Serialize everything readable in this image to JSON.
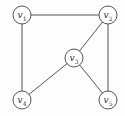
{
  "diagram": {
    "type": "graph",
    "nodes": [
      {
        "id": "v1",
        "label": "v",
        "sub": "1",
        "x": 22,
        "y": 15
      },
      {
        "id": "v2",
        "label": "v",
        "sub": "2",
        "x": 108,
        "y": 15
      },
      {
        "id": "v3",
        "label": "v",
        "sub": "3",
        "x": 74,
        "y": 58
      },
      {
        "id": "v4",
        "label": "v",
        "sub": "4",
        "x": 22,
        "y": 100
      },
      {
        "id": "v5",
        "label": "v",
        "sub": "5",
        "x": 108,
        "y": 100
      }
    ],
    "edges": [
      [
        "v1",
        "v2"
      ],
      [
        "v1",
        "v4"
      ],
      [
        "v2",
        "v3"
      ],
      [
        "v2",
        "v5"
      ],
      [
        "v3",
        "v4"
      ],
      [
        "v3",
        "v5"
      ]
    ],
    "node_radius": 9,
    "stroke_color": "#555555"
  }
}
